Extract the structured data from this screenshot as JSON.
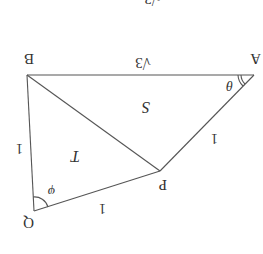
{
  "diagram": {
    "orientation": "rotated 180 degrees",
    "points": {
      "A": {
        "label": "A"
      },
      "B": {
        "label": "B"
      },
      "P": {
        "label": "P"
      },
      "Q": {
        "label": "Q"
      }
    },
    "edges": {
      "AB": {
        "length_label": "√3"
      },
      "AP": {
        "length_label": "1"
      },
      "PQ": {
        "length_label": "1"
      },
      "QB": {
        "length_label": "1"
      },
      "BP": {
        "length_label": ""
      }
    },
    "regions": {
      "triangle_ABP": {
        "area_label": "S"
      },
      "triangle_BPQ": {
        "area_label": "T"
      }
    },
    "angles": {
      "at_A": {
        "label": "θ"
      },
      "at_Q": {
        "label": "φ"
      }
    },
    "top_fragment": {
      "label": "√3"
    }
  },
  "colors": {
    "stroke": "#555555",
    "text": "#333333",
    "background": "#ffffff"
  }
}
